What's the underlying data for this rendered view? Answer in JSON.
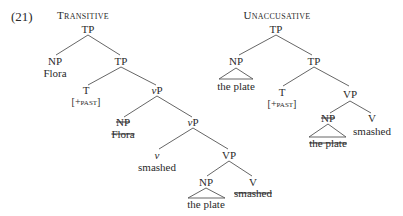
{
  "example_number": "(21)",
  "trees": [
    {
      "title": "Transitive",
      "nodes": {
        "tp_root": "TP",
        "np_subj": "NP",
        "np_subj_word": "Flora",
        "tp_bar": "TP",
        "t": "T",
        "t_feat": "[+past]",
        "vp_little": "vP",
        "np_trace": "NP",
        "np_trace_word": "Flora",
        "vp_little_bar": "vP",
        "v_little": "v",
        "v_little_word": "smashed",
        "vp": "VP",
        "np_obj": "NP",
        "np_obj_word": "the plate",
        "v": "V",
        "v_word": "smashed"
      }
    },
    {
      "title": "Unaccusative",
      "nodes": {
        "tp_root": "TP",
        "np_subj": "NP",
        "np_subj_word": "the plate",
        "tp_bar": "TP",
        "t": "T",
        "t_feat": "[+past]",
        "vp": "VP",
        "np_trace": "NP",
        "np_trace_word": "the plate",
        "v": "V",
        "v_word": "smashed"
      }
    }
  ],
  "struck_nodes": [
    "Transitive NP Flora (copy)",
    "Transitive V smashed (copy)",
    "Unaccusative NP the plate (copy)"
  ]
}
